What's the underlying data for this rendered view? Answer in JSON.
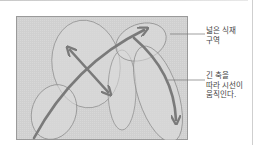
{
  "diagram": {
    "colors": {
      "background": "#d2d2d2",
      "frame": "#9a9a9a",
      "ellipse_fill": "#dcdcdc",
      "ellipse_stroke": "#8a8a8a",
      "arrow": "#7a7a7a",
      "leader_line": "#777777"
    },
    "labels": [
      {
        "id": "wide-planting-area",
        "text": "넓은 식재\n구역"
      },
      {
        "id": "gaze-along-long-axis",
        "text": "긴 축을\n따라 시선이\n움직인다."
      }
    ],
    "shapes": {
      "ellipses": 5,
      "arrows": [
        "double-headed diagonal",
        "long curve up-right",
        "curve down-right"
      ]
    }
  }
}
